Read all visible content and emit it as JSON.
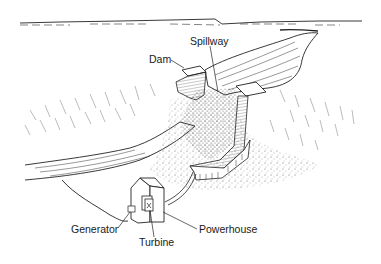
{
  "diagram": {
    "type": "illustration",
    "labels": {
      "dam": "Dam",
      "spillway": "Spillway",
      "generator": "Generator",
      "turbine": "Turbine",
      "powerhouse": "Powerhouse"
    },
    "colors": {
      "ink": "#1a1a1a",
      "stipple": "#555555",
      "background": "#ffffff"
    }
  }
}
